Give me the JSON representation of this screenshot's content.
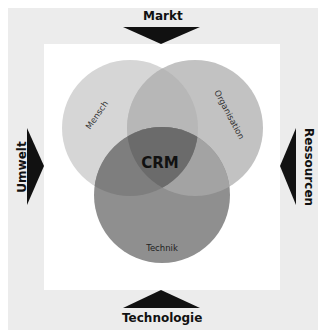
{
  "diagram": {
    "center_label": "CRM",
    "circles": [
      {
        "label": "Mensch",
        "color": "#d6d6d6"
      },
      {
        "label": "Organisation",
        "color": "#bdbdbd"
      },
      {
        "label": "Technik",
        "color": "#8f8f8f"
      }
    ],
    "intersection_color": "#6b6b6b",
    "arrows": [
      {
        "label": "Markt",
        "side": "top"
      },
      {
        "label": "Umwelt",
        "side": "left"
      },
      {
        "label": "Ressourcen",
        "side": "right"
      },
      {
        "label": "Technologie",
        "side": "bottom"
      }
    ],
    "frame_color": "#ececec"
  }
}
